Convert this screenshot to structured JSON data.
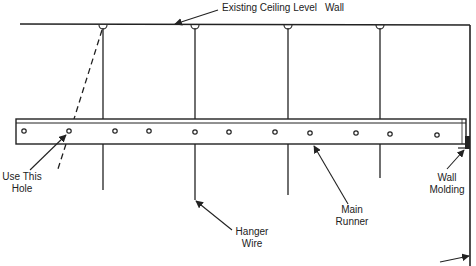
{
  "labels": {
    "ceiling": "Existing Ceiling Level",
    "wall": "Wall",
    "use_hole_line1": "Use This",
    "use_hole_line2": "Hole",
    "hanger_line1": "Hanger",
    "hanger_line2": "Wire",
    "runner_line1": "Main",
    "runner_line2": "Runner",
    "molding_line1": "Wall",
    "molding_line2": "Molding"
  },
  "colors": {
    "ink": "#222222",
    "background": "#ffffff"
  },
  "geometry": {
    "ceiling_y": 24,
    "wall_x": 470,
    "runner": {
      "x1": 16,
      "x2": 466,
      "top": 119,
      "bottom": 144
    },
    "hangers": [
      {
        "x": 103,
        "bottom": 190
      },
      {
        "x": 195,
        "bottom": 200
      },
      {
        "x": 288,
        "bottom": 195
      },
      {
        "x": 380,
        "bottom": 178
      }
    ],
    "holes_x": [
      24,
      69,
      115,
      149,
      195,
      229,
      275,
      310,
      356,
      390,
      437
    ],
    "holes_y": 131
  }
}
